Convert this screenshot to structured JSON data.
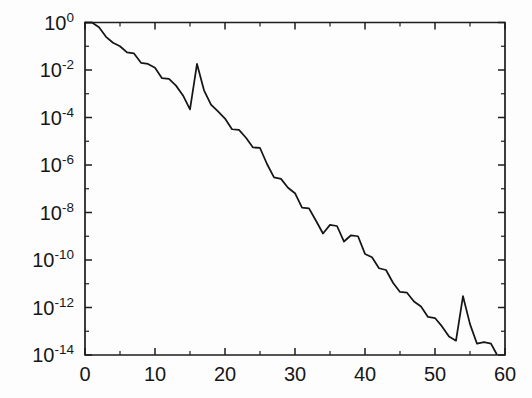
{
  "figure": {
    "background_color": "#fdfdfd",
    "line_color": "#161616",
    "axis_color": "#1d1d1d"
  },
  "chart_data": {
    "type": "line",
    "title": "",
    "subtitle": "",
    "xlabel": "",
    "ylabel": "",
    "yscale": "log",
    "xscale": "linear",
    "grid": false,
    "legend": null,
    "xlim": [
      0,
      60
    ],
    "ylim": [
      1e-14,
      1
    ],
    "xticks": [
      0,
      10,
      20,
      30,
      40,
      50,
      60
    ],
    "xtick_labels": [
      "0",
      "10",
      "20",
      "30",
      "40",
      "50",
      "60"
    ],
    "xticks_minor": [
      5,
      15,
      25,
      35,
      45,
      55
    ],
    "yticks": [
      1,
      0.01,
      0.0001,
      1e-06,
      1e-08,
      1e-10,
      1e-12,
      1e-14
    ],
    "ytick_labels": [
      {
        "mantissa": "10",
        "exponent": "0"
      },
      {
        "mantissa": "10",
        "exponent": "-2"
      },
      {
        "mantissa": "10",
        "exponent": "-4"
      },
      {
        "mantissa": "10",
        "exponent": "-6"
      },
      {
        "mantissa": "10",
        "exponent": "-8"
      },
      {
        "mantissa": "10",
        "exponent": "-10"
      },
      {
        "mantissa": "10",
        "exponent": "-12"
      },
      {
        "mantissa": "10",
        "exponent": "-14"
      }
    ],
    "yticks_minor_exponents": [
      -1,
      -3,
      -5,
      -7,
      -9,
      -11,
      -13
    ],
    "series": [
      {
        "name": "residual",
        "x": [
          0,
          1,
          2,
          3,
          4,
          5,
          6,
          7,
          8,
          9,
          10,
          11,
          12,
          13,
          14,
          15,
          16,
          17,
          18,
          19,
          20,
          21,
          22,
          23,
          24,
          25,
          26,
          27,
          28,
          29,
          30,
          31,
          32,
          33,
          34,
          35,
          36,
          37,
          38,
          39,
          40,
          41,
          42,
          43,
          44,
          45,
          46,
          47,
          48,
          49,
          50,
          51,
          52,
          53,
          54,
          55,
          56,
          57,
          58,
          58.8
        ],
        "y": [
          1.0,
          1.0,
          0.63,
          0.25,
          0.14,
          0.1,
          0.055,
          0.05,
          0.02,
          0.018,
          0.0125,
          0.0045,
          0.0042,
          0.0022,
          0.00085,
          0.00022,
          0.018,
          0.0014,
          0.00035,
          0.00018,
          9e-05,
          3.2e-05,
          3e-05,
          1.4e-05,
          5.5e-06,
          5.2e-06,
          1.1e-06,
          3e-07,
          2.6e-07,
          1.1e-07,
          6.5e-08,
          1.6e-08,
          1.5e-08,
          4.5e-09,
          1.3e-09,
          3e-09,
          2.7e-09,
          6e-10,
          1.1e-09,
          1e-09,
          1.8e-10,
          1.3e-10,
          4.5e-11,
          3.8e-11,
          1.1e-11,
          4.5e-12,
          4.2e-12,
          1.8e-12,
          1.1e-12,
          4e-13,
          3.6e-13,
          1.6e-13,
          6e-14,
          4e-14,
          3e-12,
          2e-13,
          3e-14,
          3.5e-14,
          3e-14,
          1.1e-14
        ]
      }
    ]
  }
}
